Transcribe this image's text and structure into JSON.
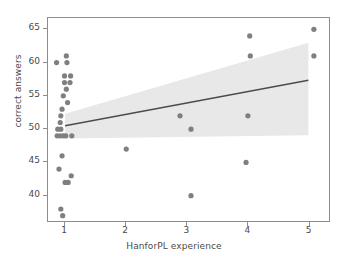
{
  "chart_data": {
    "type": "scatter",
    "title": "",
    "xlabel": "HanforPL experience",
    "ylabel": "correct answers",
    "xlim": [
      0.72,
      5.35
    ],
    "ylim": [
      35.9,
      66.7
    ],
    "xticks": [
      1,
      2,
      3,
      4,
      5
    ],
    "yticks": [
      40,
      45,
      50,
      55,
      60,
      65
    ],
    "grid": false,
    "legend": null,
    "marker_color": "#7f7f7f",
    "line_color": "#4c4c4c",
    "band_color": "#e8e8e8",
    "points": [
      {
        "x": 0.86,
        "y": 60
      },
      {
        "x": 1.02,
        "y": 61
      },
      {
        "x": 1.03,
        "y": 60
      },
      {
        "x": 0.99,
        "y": 58
      },
      {
        "x": 1.09,
        "y": 58
      },
      {
        "x": 0.99,
        "y": 57
      },
      {
        "x": 1.08,
        "y": 57
      },
      {
        "x": 1.02,
        "y": 56
      },
      {
        "x": 0.97,
        "y": 55
      },
      {
        "x": 1.04,
        "y": 54
      },
      {
        "x": 0.95,
        "y": 53
      },
      {
        "x": 0.93,
        "y": 52
      },
      {
        "x": 0.92,
        "y": 51
      },
      {
        "x": 0.88,
        "y": 50
      },
      {
        "x": 0.93,
        "y": 50
      },
      {
        "x": 0.87,
        "y": 49
      },
      {
        "x": 0.92,
        "y": 49
      },
      {
        "x": 0.97,
        "y": 49
      },
      {
        "x": 1.01,
        "y": 49
      },
      {
        "x": 1.11,
        "y": 49
      },
      {
        "x": 0.95,
        "y": 46
      },
      {
        "x": 0.9,
        "y": 44
      },
      {
        "x": 1.1,
        "y": 43
      },
      {
        "x": 1.0,
        "y": 42
      },
      {
        "x": 1.05,
        "y": 42
      },
      {
        "x": 0.93,
        "y": 38
      },
      {
        "x": 0.96,
        "y": 37
      },
      {
        "x": 2.0,
        "y": 47
      },
      {
        "x": 2.88,
        "y": 52
      },
      {
        "x": 3.06,
        "y": 50
      },
      {
        "x": 3.06,
        "y": 40
      },
      {
        "x": 4.02,
        "y": 64
      },
      {
        "x": 4.03,
        "y": 61
      },
      {
        "x": 3.99,
        "y": 52
      },
      {
        "x": 3.96,
        "y": 45
      },
      {
        "x": 5.07,
        "y": 65
      },
      {
        "x": 5.07,
        "y": 61
      }
    ],
    "regression_line": {
      "x_start": 1.0,
      "y_start": 50.5,
      "x_end": 4.98,
      "y_end": 57.35
    },
    "confidence_band": {
      "x_start": 1.0,
      "x_end": 4.98,
      "upper_start": 52.3,
      "upper_end": 63.0,
      "lower_start": 48.6,
      "lower_end": 49.1
    }
  }
}
